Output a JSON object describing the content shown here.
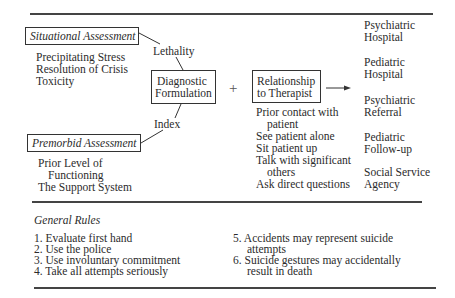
{
  "diagram": {
    "situational_assessment": {
      "title": "Situational Assessment",
      "items": [
        "Precipitating Stress",
        "Resolution of Crisis",
        "Toxicity"
      ]
    },
    "premorbid_assessment": {
      "title": "Premorbid Assessment",
      "items": [
        "Prior Level of",
        "Functioning",
        "The Support System"
      ]
    },
    "connector_labels": {
      "top": "Lethality",
      "bottom": "Index"
    },
    "diagnostic_formulation": {
      "line1": "Diagnostic",
      "line2": "Formulation"
    },
    "plus_symbol": "+",
    "relationship_to_therapist": {
      "line1": "Relationship",
      "line2": "to Therapist",
      "items": [
        "Prior contact with",
        "patient",
        "See patient alone",
        "Sit patient up",
        "Talk with significant",
        "others",
        "Ask direct questions"
      ]
    },
    "outcomes": [
      {
        "line1": "Psychiatric",
        "line2": "Hospital"
      },
      {
        "line1": "Pediatric",
        "line2": "Hospital"
      },
      {
        "line1": "Psychiatric",
        "line2": "Referral"
      },
      {
        "line1": "Pediatric",
        "line2": "Follow-up"
      },
      {
        "line1": "Social Service",
        "line2": "Agency"
      }
    ]
  },
  "general_rules": {
    "title": "General Rules",
    "left": [
      "1. Evaluate first hand",
      "2. Use the police",
      "3. Use involuntary commitment",
      "4. Take all attempts seriously"
    ],
    "right": [
      {
        "line1": "5. Accidents may represent suicide",
        "line2": "attempts"
      },
      {
        "line1": "6. Suicide gestures may accidentally",
        "line2": "result in death"
      }
    ]
  }
}
